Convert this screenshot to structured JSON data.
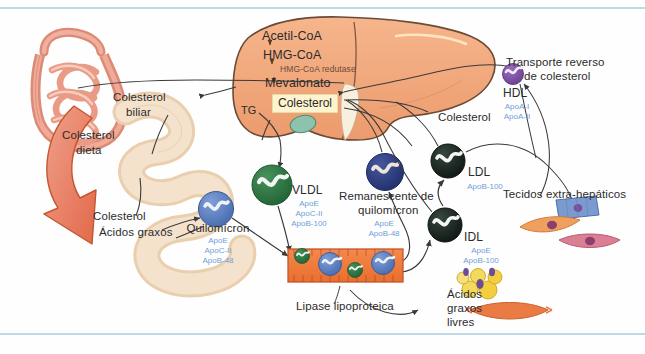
{
  "figure": {
    "frame_color": "#bcd9e6",
    "background": "#fefefe"
  },
  "liver": {
    "pathway": {
      "step1": "Acetil-CoA",
      "step2": "HMG-CoA",
      "enzyme": "HMG-CoA redutase",
      "step3": "Mevalonato",
      "product": "Colesterol"
    },
    "tg_label": "TG",
    "color": "#f0a478",
    "outline": "#6b4a36"
  },
  "intestine": {
    "dietary_label_line1": "Colesterol",
    "dietary_label_line2": "dieta",
    "lumen_label_line1": "Colesterol",
    "lumen_label_line2": "Ácidos graxos",
    "color": "#e8846a"
  },
  "bile": {
    "label_line1": "Colesterol",
    "label_line2": "biliar"
  },
  "lipoproteins": [
    {
      "id": "quilomicron",
      "name": "Quilomícron",
      "apos": [
        "ApoE",
        "ApoC-II",
        "ApoB-48"
      ],
      "color": "#5c7fc0"
    },
    {
      "id": "vldl",
      "name": "VLDL",
      "apos": [
        "ApoE",
        "ApoC-II",
        "ApoB-100"
      ],
      "color": "#2f7a45"
    },
    {
      "id": "remanescente",
      "name_line1": "Remanescente de",
      "name_line2": "quilomícron",
      "apos": [
        "ApoE",
        "ApoB-48"
      ],
      "color": "#2e3f82"
    },
    {
      "id": "ldl",
      "name": "LDL",
      "apos": [
        "ApoB-100"
      ],
      "color": "#1c2a26"
    },
    {
      "id": "idl",
      "name": "IDL",
      "apos": [
        "ApoE",
        "ApoB-100"
      ],
      "color": "#1c2a26"
    },
    {
      "id": "hdl",
      "name": "HDL",
      "apos": [
        "ApoA-I",
        "ApoA-II"
      ],
      "color": "#7a4f9e"
    }
  ],
  "reverse_transport": {
    "line1": "Transporte reverso",
    "line2": "de colesterol"
  },
  "cholesterol_right_label": "Colesterol",
  "capillary": {
    "label": "Lipase lipoproteica",
    "color": "#ef7a3d"
  },
  "free_fatty_acids": {
    "line1": "Ácidos",
    "line2": "graxos",
    "line3": "livres"
  },
  "tissues": {
    "label": "Tecidos extra-hepáticos"
  }
}
